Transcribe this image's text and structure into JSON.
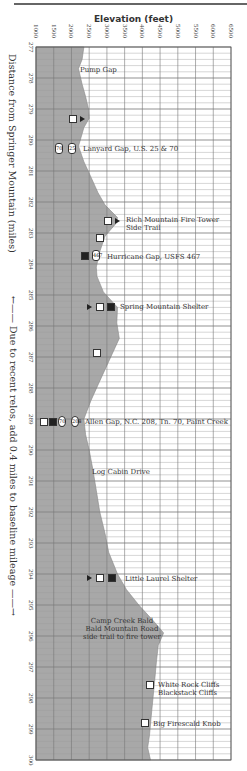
{
  "chart_data": {
    "type": "area",
    "title": "",
    "xlabel": "Elevation (feet)",
    "ylabel": "Distance from Springer Mountain (miles)",
    "orientation": "vertical-profile",
    "x_ticks": [
      1000,
      1500,
      2000,
      2500,
      3000,
      3500,
      4000,
      4500,
      5000,
      5500,
      6000,
      6500
    ],
    "y_ticks": [
      277,
      278,
      279,
      280,
      281,
      282,
      283,
      284,
      285,
      286,
      287,
      288,
      289,
      290,
      291,
      292,
      293,
      294,
      295,
      296,
      297,
      298,
      299,
      300
    ],
    "xlim": [
      1000,
      6500
    ],
    "ylim": [
      277,
      300
    ],
    "grid": true,
    "profile": [
      {
        "mile": 277.0,
        "elev": 2350
      },
      {
        "mile": 277.4,
        "elev": 2300
      },
      {
        "mile": 277.7,
        "elev": 2200
      },
      {
        "mile": 278.2,
        "elev": 2300
      },
      {
        "mile": 278.6,
        "elev": 2400
      },
      {
        "mile": 279.0,
        "elev": 2480
      },
      {
        "mile": 279.3,
        "elev": 2500
      },
      {
        "mile": 279.6,
        "elev": 2350
      },
      {
        "mile": 280.0,
        "elev": 2250
      },
      {
        "mile": 280.2,
        "elev": 2200
      },
      {
        "mile": 280.7,
        "elev": 2350
      },
      {
        "mile": 281.2,
        "elev": 2550
      },
      {
        "mile": 281.7,
        "elev": 2750
      },
      {
        "mile": 282.1,
        "elev": 2950
      },
      {
        "mile": 282.5,
        "elev": 3300
      },
      {
        "mile": 282.7,
        "elev": 3250
      },
      {
        "mile": 283.1,
        "elev": 2950
      },
      {
        "mile": 283.6,
        "elev": 2800
      },
      {
        "mile": 284.1,
        "elev": 2700
      },
      {
        "mile": 284.4,
        "elev": 2720
      },
      {
        "mile": 284.9,
        "elev": 2900
      },
      {
        "mile": 285.4,
        "elev": 3300
      },
      {
        "mile": 285.9,
        "elev": 3280
      },
      {
        "mile": 286.4,
        "elev": 3350
      },
      {
        "mile": 286.9,
        "elev": 3150
      },
      {
        "mile": 287.4,
        "elev": 2950
      },
      {
        "mile": 287.9,
        "elev": 2750
      },
      {
        "mile": 288.4,
        "elev": 2550
      },
      {
        "mile": 289.0,
        "elev": 2350
      },
      {
        "mile": 289.5,
        "elev": 2400
      },
      {
        "mile": 290.0,
        "elev": 2500
      },
      {
        "mile": 290.6,
        "elev": 2600
      },
      {
        "mile": 291.3,
        "elev": 2700
      },
      {
        "mile": 292.0,
        "elev": 2800
      },
      {
        "mile": 292.7,
        "elev": 2950
      },
      {
        "mile": 293.3,
        "elev": 3050
      },
      {
        "mile": 294.0,
        "elev": 3300
      },
      {
        "mile": 294.5,
        "elev": 3550
      },
      {
        "mile": 295.0,
        "elev": 3900
      },
      {
        "mile": 295.5,
        "elev": 4300
      },
      {
        "mile": 295.9,
        "elev": 4600
      },
      {
        "mile": 296.3,
        "elev": 4450
      },
      {
        "mile": 296.8,
        "elev": 4400
      },
      {
        "mile": 297.4,
        "elev": 4350
      },
      {
        "mile": 298.0,
        "elev": 4300
      },
      {
        "mile": 298.6,
        "elev": 4250
      },
      {
        "mile": 299.2,
        "elev": 4200
      },
      {
        "mile": 299.6,
        "elev": 4150
      },
      {
        "mile": 300.0,
        "elev": 4230
      }
    ],
    "annotations": [
      {
        "mile": 277.7,
        "label": "Pump Gap"
      },
      {
        "mile": 279.3,
        "label": "",
        "icons": [
          "viewpoint",
          "campsite"
        ]
      },
      {
        "mile": 280.2,
        "label": "Lanyard Gap, U.S. 25 & 70",
        "icons": [
          "route-70",
          "route-25"
        ]
      },
      {
        "mile": 282.6,
        "label": "Rich Mountain Fire Tower Side Trail",
        "icons": [
          "viewpoint",
          "campsite"
        ]
      },
      {
        "mile": 283.3,
        "label": "",
        "icons": [
          "viewpoint"
        ]
      },
      {
        "mile": 284.3,
        "label": "Hurricane Gap, USFS 467",
        "icons": [
          "parking",
          "forest-road"
        ]
      },
      {
        "mile": 285.4,
        "label": "Spring Mountain Shelter",
        "icons": [
          "campsite",
          "viewpoint",
          "shelter"
        ]
      },
      {
        "mile": 287.0,
        "label": "",
        "icons": [
          "viewpoint"
        ]
      },
      {
        "mile": 289.0,
        "label": "Allen Gap, N.C. 208, Tn. 70, Paint Creek",
        "icons": [
          "viewpoint",
          "parking",
          "route-70",
          "route-208"
        ]
      },
      {
        "mile": 290.7,
        "label": "Log Cabin Drive"
      },
      {
        "mile": 294.0,
        "label": "Little Laurel Shelter",
        "icons": [
          "campsite",
          "viewpoint",
          "shelter"
        ]
      },
      {
        "mile": 295.9,
        "label": "Camp Creek Bald, Bald Mountain Road, side trail to fire tower"
      },
      {
        "mile": 298.0,
        "label": "White Rock Cliffs, Blackstack Cliffs",
        "icons": [
          "viewpoint"
        ]
      },
      {
        "mile": 299.2,
        "label": "Big Firescald Knob",
        "icons": [
          "viewpoint"
        ]
      }
    ],
    "notes": [
      "Due to recent relos, add 0.4 miles to baseline mileage"
    ]
  },
  "axis": {
    "x_title": "Elevation (feet)",
    "y_title": "Distance from Springer Mountain (miles)",
    "x_ticks": [
      "1000",
      "1500",
      "2000",
      "2500",
      "3000",
      "3500",
      "4000",
      "4500",
      "5000",
      "5500",
      "6000",
      "6500"
    ],
    "y_ticks": [
      "277",
      "278",
      "279",
      "280",
      "281",
      "282",
      "283",
      "284",
      "285",
      "286",
      "287",
      "288",
      "289",
      "290",
      "291",
      "292",
      "293",
      "294",
      "295",
      "296",
      "297",
      "298",
      "299",
      "300"
    ]
  },
  "note": "←——  Due to recent relos, add 0.4 miles to baseline mileage  ——→",
  "labels": {
    "pump_gap": "Pump Gap",
    "lanyard_gap": "Lanyard Gap, U.S. 25 & 70",
    "rich_mtn_1": "Rich Mountain Fire Tower",
    "rich_mtn_2": "Side Trail",
    "hurricane_gap": "Hurricane Gap, USFS 467",
    "spring_mtn": "Spring Mountain Shelter",
    "allen_gap": "Allen Gap, N.C. 208, Tn. 70, Paint Creek",
    "log_cabin": "Log Cabin Drive",
    "little_laurel": "Little Laurel Shelter",
    "camp_creek_1": "Camp Creek Bald",
    "camp_creek_2": "Bald Mountain Road",
    "camp_creek_3": "side trail to fire tower",
    "white_rock_1": "White Rock Cliffs",
    "white_rock_2": "Blackstack Cliffs",
    "big_firescald": "Big Firescald Knob"
  },
  "shields": {
    "us70": "70",
    "us25": "25",
    "usfs467": "467",
    "tn70": "70",
    "nc208": "208"
  },
  "colors": {
    "profile_fill": "#a8a8a8",
    "grid_major": "#777777",
    "grid_minor": "#c4c4c4",
    "background": "#ffffff"
  }
}
